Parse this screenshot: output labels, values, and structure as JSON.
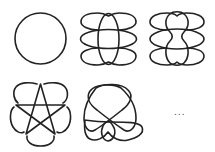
{
  "figure": {
    "items": [
      {
        "id": "unknot",
        "label": "circle"
      },
      {
        "id": "four-ellipse-link",
        "label": "four overlapping loops"
      },
      {
        "id": "pinched-four-loop-link",
        "label": "four loops with pinched center"
      },
      {
        "id": "pentagram-knot",
        "label": "pentagram with petal loops"
      },
      {
        "id": "complex-knot",
        "label": "interlaced loops knot"
      }
    ],
    "continuation": "..."
  },
  "colors": {
    "stroke": "#222222",
    "background": "#ffffff"
  }
}
